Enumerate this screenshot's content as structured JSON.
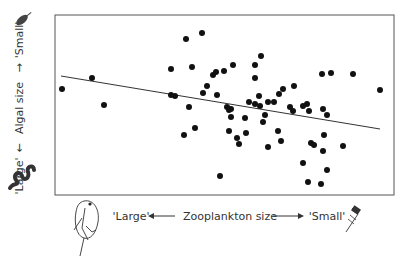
{
  "chart_data": {
    "type": "scatter",
    "title": "",
    "xlabel": "Zooplankton size",
    "ylabel": "Algal size",
    "x_direction_labels": {
      "left": "'Large'",
      "right": "'Small'"
    },
    "y_direction_labels": {
      "bottom": "'Large'",
      "top": "'Small'"
    },
    "x_ticks": [],
    "y_ticks": [],
    "grid": false,
    "legend": null,
    "xlim": [
      0,
      10
    ],
    "ylim": [
      0,
      10
    ],
    "frame_px": {
      "left": 55,
      "top": 15,
      "right": 394,
      "bottom": 195
    },
    "trendline": {
      "type": "linear",
      "x": [
        0.18,
        9.59
      ],
      "y": [
        6.6,
        3.7
      ],
      "px": [
        [
          61,
          76
        ],
        [
          380,
          129
        ]
      ]
    },
    "points_px": [
      [
        62,
        89
      ],
      [
        92,
        78
      ],
      [
        104,
        105
      ],
      [
        171,
        69
      ],
      [
        186,
        39
      ],
      [
        202,
        33
      ],
      [
        192,
        67
      ],
      [
        171,
        95
      ],
      [
        175,
        96
      ],
      [
        189,
        107
      ],
      [
        184,
        135
      ],
      [
        195,
        128
      ],
      [
        203,
        93
      ],
      [
        207,
        86
      ],
      [
        213,
        75
      ],
      [
        216,
        72
      ],
      [
        224,
        71
      ],
      [
        233,
        65
      ],
      [
        217,
        95
      ],
      [
        227,
        107
      ],
      [
        229,
        110
      ],
      [
        231,
        109
      ],
      [
        231,
        117
      ],
      [
        229,
        131
      ],
      [
        237,
        138
      ],
      [
        239,
        144
      ],
      [
        220,
        176
      ],
      [
        245,
        118
      ],
      [
        246,
        133
      ],
      [
        255,
        65
      ],
      [
        261,
        56
      ],
      [
        255,
        78
      ],
      [
        259,
        96
      ],
      [
        249,
        102
      ],
      [
        255,
        104
      ],
      [
        260,
        106
      ],
      [
        265,
        115
      ],
      [
        263,
        122
      ],
      [
        268,
        147
      ],
      [
        268,
        102
      ],
      [
        274,
        102
      ],
      [
        279,
        94
      ],
      [
        283,
        89
      ],
      [
        294,
        86
      ],
      [
        278,
        131
      ],
      [
        281,
        141
      ],
      [
        290,
        107
      ],
      [
        293,
        111
      ],
      [
        303,
        163
      ],
      [
        308,
        182
      ],
      [
        321,
        184
      ],
      [
        303,
        106
      ],
      [
        307,
        104
      ],
      [
        309,
        111
      ],
      [
        311,
        143
      ],
      [
        314,
        145
      ],
      [
        324,
        135
      ],
      [
        323,
        151
      ],
      [
        327,
        170
      ],
      [
        323,
        109
      ],
      [
        327,
        115
      ],
      [
        322,
        74
      ],
      [
        331,
        73
      ],
      [
        353,
        74
      ],
      [
        380,
        90
      ],
      [
        343,
        146
      ]
    ],
    "note": "Unlabeled axes; points given in pixel coordinates of the plot frame. Higher x = smaller zooplankton, higher y = smaller algae."
  },
  "labels": {
    "x_axis_title": "Zooplankton size",
    "x_left": "'Large'",
    "x_right": "'Small'",
    "y_axis_title": "Algal size",
    "y_bottom": "'Large'",
    "y_top": "'Small'"
  },
  "icons": {
    "large_zooplankton": "daphnia-icon",
    "small_zooplankton": "rotifer-icon",
    "large_algae": "filamentous-alga-icon",
    "small_algae": "small-alga-cell-icon"
  },
  "colors": {
    "points": "#111111",
    "frame": "#555555",
    "trendline": "#333333",
    "text": "#333333"
  }
}
